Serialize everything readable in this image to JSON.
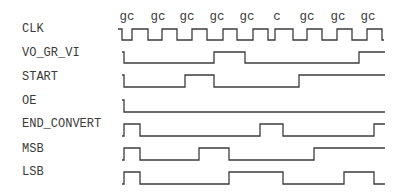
{
  "diagram": {
    "type": "timing-diagram",
    "colors": {
      "line": "#3c3c3c",
      "text": "#3a3a3a",
      "background": "#ffffff"
    },
    "clock_phase_labels": [
      "gc",
      "gc",
      "gc",
      "gc",
      "gc",
      "c",
      "gc",
      "gc",
      "gc"
    ],
    "clock_phase_label_x": [
      127,
      158,
      187,
      217,
      247,
      277,
      307,
      338,
      368
    ],
    "signals": [
      {
        "name": "CLK",
        "label_y": 32,
        "high_y": 29,
        "low_y": 40,
        "points": [
          [
            118,
            29
          ],
          [
            122,
            29
          ],
          [
            122,
            40
          ],
          [
            132,
            40
          ],
          [
            132,
            29
          ],
          [
            148,
            29
          ],
          [
            148,
            40
          ],
          [
            162,
            40
          ],
          [
            162,
            29
          ],
          [
            177,
            29
          ],
          [
            177,
            40
          ],
          [
            192,
            40
          ],
          [
            192,
            29
          ],
          [
            207,
            29
          ],
          [
            207,
            40
          ],
          [
            223,
            40
          ],
          [
            223,
            29
          ],
          [
            237,
            29
          ],
          [
            237,
            40
          ],
          [
            253,
            40
          ],
          [
            253,
            29
          ],
          [
            268,
            29
          ],
          [
            268,
            40
          ],
          [
            275,
            40
          ],
          [
            275,
            29
          ],
          [
            293,
            29
          ],
          [
            293,
            40
          ],
          [
            307,
            40
          ],
          [
            307,
            29
          ],
          [
            322,
            29
          ],
          [
            322,
            40
          ],
          [
            337,
            40
          ],
          [
            337,
            29
          ],
          [
            352,
            29
          ],
          [
            352,
            40
          ],
          [
            367,
            40
          ],
          [
            367,
            29
          ],
          [
            382,
            29
          ],
          [
            382,
            40
          ],
          [
            384,
            40
          ]
        ]
      },
      {
        "name": "VO_GR_VI",
        "label_y": 56,
        "high_y": 52,
        "low_y": 63,
        "points": [
          [
            122,
            52
          ],
          [
            124,
            52
          ],
          [
            124,
            63
          ],
          [
            214,
            63
          ],
          [
            214,
            52
          ],
          [
            245,
            52
          ],
          [
            245,
            63
          ],
          [
            359,
            63
          ],
          [
            359,
            52
          ],
          [
            385,
            52
          ]
        ]
      },
      {
        "name": "START",
        "label_y": 80,
        "high_y": 75,
        "low_y": 87,
        "points": [
          [
            122,
            75
          ],
          [
            124,
            75
          ],
          [
            124,
            87
          ],
          [
            185,
            87
          ],
          [
            185,
            75
          ],
          [
            214,
            75
          ],
          [
            214,
            87
          ],
          [
            299,
            87
          ],
          [
            299,
            75
          ],
          [
            385,
            75
          ]
        ]
      },
      {
        "name": "OE",
        "label_y": 104,
        "high_y": 100,
        "low_y": 112,
        "points": [
          [
            122,
            100
          ],
          [
            124,
            100
          ],
          [
            124,
            112
          ],
          [
            385,
            112
          ]
        ]
      },
      {
        "name": "END_CONVERT",
        "label_y": 127,
        "high_y": 124,
        "low_y": 136,
        "points": [
          [
            122,
            136
          ],
          [
            124,
            136
          ],
          [
            124,
            124
          ],
          [
            140,
            124
          ],
          [
            140,
            136
          ],
          [
            260,
            136
          ],
          [
            260,
            124
          ],
          [
            283,
            124
          ],
          [
            283,
            136
          ],
          [
            374,
            136
          ],
          [
            374,
            124
          ],
          [
            385,
            124
          ]
        ]
      },
      {
        "name": "MSB",
        "label_y": 152,
        "high_y": 148,
        "low_y": 160,
        "points": [
          [
            122,
            160
          ],
          [
            124,
            160
          ],
          [
            124,
            148
          ],
          [
            140,
            148
          ],
          [
            140,
            160
          ],
          [
            199,
            160
          ],
          [
            199,
            148
          ],
          [
            229,
            148
          ],
          [
            229,
            160
          ],
          [
            314,
            160
          ],
          [
            314,
            148
          ],
          [
            385,
            148
          ]
        ]
      },
      {
        "name": "LSB",
        "label_y": 175,
        "high_y": 172,
        "low_y": 184,
        "points": [
          [
            122,
            184
          ],
          [
            124,
            184
          ],
          [
            124,
            172
          ],
          [
            140,
            172
          ],
          [
            140,
            184
          ],
          [
            229,
            184
          ],
          [
            229,
            172
          ],
          [
            283,
            172
          ],
          [
            283,
            184
          ],
          [
            344,
            184
          ],
          [
            344,
            172
          ],
          [
            374,
            172
          ],
          [
            374,
            184
          ],
          [
            385,
            184
          ]
        ]
      }
    ]
  }
}
